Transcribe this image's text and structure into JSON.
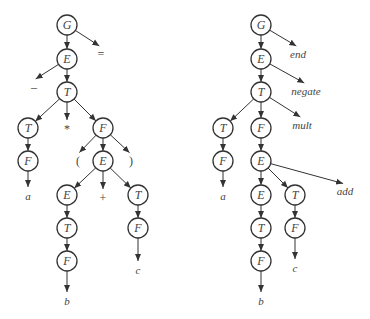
{
  "trees": [
    {
      "id": "parse-tree",
      "nodes": [
        {
          "id": "G",
          "label": "G",
          "x": 67,
          "y": 25
        },
        {
          "id": "E1",
          "label": "E",
          "x": 67,
          "y": 59
        },
        {
          "id": "T1",
          "label": "T",
          "x": 67,
          "y": 92
        },
        {
          "id": "T2",
          "label": "T",
          "x": 28,
          "y": 128
        },
        {
          "id": "F1",
          "label": "F",
          "x": 103,
          "y": 128
        },
        {
          "id": "F2",
          "label": "F",
          "x": 28,
          "y": 161
        },
        {
          "id": "E2",
          "label": "E",
          "x": 103,
          "y": 161
        },
        {
          "id": "E3",
          "label": "E",
          "x": 67,
          "y": 195
        },
        {
          "id": "T3",
          "label": "T",
          "x": 138,
          "y": 195
        },
        {
          "id": "T4",
          "label": "T",
          "x": 67,
          "y": 228
        },
        {
          "id": "F3",
          "label": "F",
          "x": 138,
          "y": 228
        },
        {
          "id": "F4",
          "label": "F",
          "x": 67,
          "y": 261
        }
      ],
      "leaves": [
        {
          "id": "eq",
          "label": "=",
          "x": 101,
          "y": 56,
          "symbol": true
        },
        {
          "id": "minus",
          "label": "–",
          "x": 34,
          "y": 89,
          "symbol": true
        },
        {
          "id": "star",
          "label": "*",
          "x": 67,
          "y": 131,
          "symbol": true
        },
        {
          "id": "lparen",
          "label": "(",
          "x": 78,
          "y": 163,
          "symbol": true
        },
        {
          "id": "rparen",
          "label": ")",
          "x": 131,
          "y": 163,
          "symbol": true
        },
        {
          "id": "a",
          "label": "a",
          "x": 28,
          "y": 198,
          "symbol": false
        },
        {
          "id": "plus",
          "label": "+",
          "x": 103,
          "y": 200,
          "symbol": true
        },
        {
          "id": "c",
          "label": "c",
          "x": 138,
          "y": 272,
          "symbol": false
        },
        {
          "id": "b",
          "label": "b",
          "x": 67,
          "y": 303,
          "symbol": false
        }
      ],
      "edges": [
        [
          "G",
          "E1"
        ],
        [
          "G",
          "eq"
        ],
        [
          "E1",
          "minus"
        ],
        [
          "E1",
          "T1"
        ],
        [
          "T1",
          "T2"
        ],
        [
          "T1",
          "star"
        ],
        [
          "T1",
          "F1"
        ],
        [
          "T2",
          "F2"
        ],
        [
          "F2",
          "a"
        ],
        [
          "F1",
          "lparen"
        ],
        [
          "F1",
          "E2"
        ],
        [
          "F1",
          "rparen"
        ],
        [
          "E2",
          "E3"
        ],
        [
          "E2",
          "plus"
        ],
        [
          "E2",
          "T3"
        ],
        [
          "E3",
          "T4"
        ],
        [
          "T4",
          "F4"
        ],
        [
          "F4",
          "b"
        ],
        [
          "T3",
          "F3"
        ],
        [
          "F3",
          "c"
        ]
      ]
    },
    {
      "id": "abstract-syntax-tree",
      "nodes": [
        {
          "id": "G",
          "label": "G",
          "x": 261,
          "y": 25
        },
        {
          "id": "E1",
          "label": "E",
          "x": 261,
          "y": 59
        },
        {
          "id": "T1",
          "label": "T",
          "x": 261,
          "y": 92
        },
        {
          "id": "T2",
          "label": "T",
          "x": 223,
          "y": 128
        },
        {
          "id": "F1",
          "label": "F",
          "x": 261,
          "y": 128
        },
        {
          "id": "F2",
          "label": "F",
          "x": 223,
          "y": 161
        },
        {
          "id": "E2",
          "label": "E",
          "x": 261,
          "y": 161
        },
        {
          "id": "E3",
          "label": "E",
          "x": 261,
          "y": 195
        },
        {
          "id": "T3",
          "label": "T",
          "x": 295,
          "y": 195
        },
        {
          "id": "T4",
          "label": "T",
          "x": 261,
          "y": 228
        },
        {
          "id": "F3",
          "label": "F",
          "x": 295,
          "y": 228
        },
        {
          "id": "F4",
          "label": "F",
          "x": 261,
          "y": 261
        }
      ],
      "leaves": [
        {
          "id": "end",
          "label": "end",
          "x": 298,
          "y": 56,
          "symbol": false
        },
        {
          "id": "negate",
          "label": "negate",
          "x": 306,
          "y": 93,
          "symbol": false
        },
        {
          "id": "mult",
          "label": "mult",
          "x": 302,
          "y": 127,
          "symbol": false
        },
        {
          "id": "add",
          "label": "add",
          "x": 345,
          "y": 193,
          "symbol": false
        },
        {
          "id": "a",
          "label": "a",
          "x": 223,
          "y": 198,
          "symbol": false
        },
        {
          "id": "c",
          "label": "c",
          "x": 295,
          "y": 270,
          "symbol": false
        },
        {
          "id": "b",
          "label": "b",
          "x": 261,
          "y": 303,
          "symbol": false
        }
      ],
      "edges": [
        [
          "G",
          "E1"
        ],
        [
          "G",
          "end"
        ],
        [
          "E1",
          "T1"
        ],
        [
          "E1",
          "negate"
        ],
        [
          "T1",
          "T2"
        ],
        [
          "T1",
          "F1"
        ],
        [
          "T1",
          "mult"
        ],
        [
          "T2",
          "F2"
        ],
        [
          "F2",
          "a"
        ],
        [
          "F1",
          "E2"
        ],
        [
          "E2",
          "E3"
        ],
        [
          "E2",
          "T3"
        ],
        [
          "E2",
          "add"
        ],
        [
          "E3",
          "T4"
        ],
        [
          "T4",
          "F4"
        ],
        [
          "F4",
          "b"
        ],
        [
          "T3",
          "F3"
        ],
        [
          "F3",
          "c"
        ]
      ]
    }
  ],
  "style": {
    "stroke": "#333333",
    "text": "#444444",
    "node_radius": 10
  }
}
